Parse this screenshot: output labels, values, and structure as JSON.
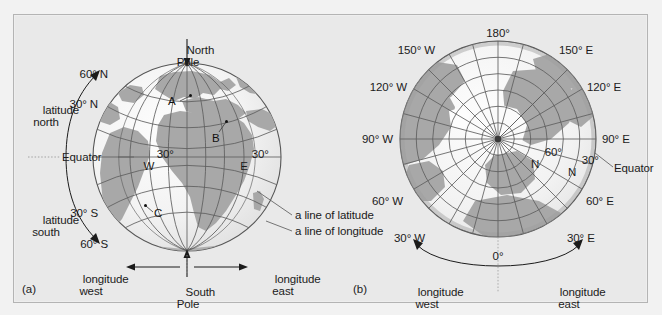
{
  "figure": {
    "background_color": "#e9e9e9",
    "frame_border_color": "#b4b4b4",
    "ocean_color": "#f4f4f4",
    "land_color": "#a8a8a8",
    "grid_color": "#5a5a5a",
    "text_color": "#1b1b1b"
  },
  "panel_a": {
    "id_label": "(a)",
    "type": "globe-side-view",
    "title_top": "North\nPole",
    "title_top_line1": "North",
    "title_top_line2": "Pole",
    "title_bottom_line1": "South",
    "title_bottom_line2": "Pole",
    "latitude_labels": [
      {
        "text": "60° N",
        "lat": 60
      },
      {
        "text": "30° N",
        "lat": 30
      },
      {
        "text": "Equator",
        "lat": 0
      },
      {
        "text": "30° S",
        "lat": -30
      },
      {
        "text": "60° S",
        "lat": -60
      }
    ],
    "longitude_labels": [
      {
        "line1": "30°",
        "line2": "W",
        "lon": -30
      },
      {
        "line1": "30°",
        "line2": "E",
        "lon": 30
      }
    ],
    "arc_labels": [
      {
        "line1": "latitude",
        "line2": "north"
      },
      {
        "line1": "latitude",
        "line2": "south"
      }
    ],
    "bottom_labels": [
      {
        "line1": "longitude",
        "line2": "west"
      },
      {
        "line1": "longitude",
        "line2": "east"
      }
    ],
    "callouts": [
      "a line of latitude",
      "a line of longitude"
    ],
    "point_markers": [
      "A",
      "B",
      "C"
    ]
  },
  "panel_b": {
    "id_label": "(b)",
    "type": "polar-azimuthal-projection",
    "meridian_labels": [
      {
        "text": "180°",
        "lon": 180
      },
      {
        "text": "150° W",
        "lon": -150
      },
      {
        "text": "150° E",
        "lon": 150
      },
      {
        "text": "120° W",
        "lon": -120
      },
      {
        "text": "120° E",
        "lon": 120
      },
      {
        "text": "90° W",
        "lon": -90
      },
      {
        "text": "90° E",
        "lon": 90
      },
      {
        "text": "60° W",
        "lon": -60
      },
      {
        "text": "60° E",
        "lon": 60
      },
      {
        "text": "30° W",
        "lon": -30
      },
      {
        "text": "30° E",
        "lon": 30
      },
      {
        "text": "0°",
        "lon": 0
      }
    ],
    "parallel_labels": [
      {
        "line1": "60°",
        "line2": "N",
        "lat": 60
      },
      {
        "line1": "30°",
        "line2": "N",
        "lat": 30
      },
      {
        "text": "Equator",
        "lat": 0
      }
    ],
    "bottom_labels": [
      {
        "line1": "longitude",
        "line2": "west"
      },
      {
        "line1": "longitude",
        "line2": "east"
      }
    ]
  }
}
